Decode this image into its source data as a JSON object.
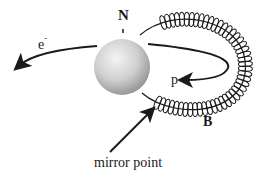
{
  "diagram": {
    "labels": {
      "north_pole": "N",
      "electron": "e",
      "electron_charge": "-",
      "proton": "p",
      "magnetic_field": "B",
      "mirror_point": "mirror point"
    },
    "colors": {
      "ink": "#1a1a1a",
      "sphere_light": "#f2f2f2",
      "sphere_dark": "#9a9a9a",
      "background": "#ffffff"
    }
  }
}
